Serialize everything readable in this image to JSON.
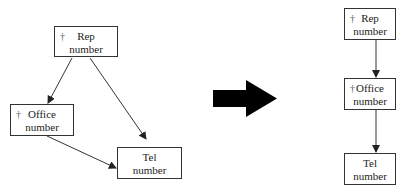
{
  "left_diagram": {
    "nodes": [
      {
        "id": "rep",
        "dagger": "†",
        "line1": "Rep",
        "line2": "number"
      },
      {
        "id": "office",
        "dagger": "†",
        "line1": "Office",
        "line2": "number"
      },
      {
        "id": "tel",
        "dagger": "",
        "line1": "Tel",
        "line2": "number"
      }
    ],
    "edges": [
      [
        "rep",
        "office"
      ],
      [
        "rep",
        "tel"
      ],
      [
        "office",
        "tel"
      ]
    ]
  },
  "transform_arrow": "right",
  "right_diagram": {
    "nodes": [
      {
        "id": "rep",
        "dagger": "†",
        "line1": "Rep",
        "line2": "number"
      },
      {
        "id": "office",
        "dagger": "†",
        "line1": "Office",
        "line2": "number"
      },
      {
        "id": "tel",
        "dagger": "",
        "line1": "Tel",
        "line2": "number"
      }
    ],
    "edges": [
      [
        "rep",
        "office"
      ],
      [
        "office",
        "tel"
      ]
    ]
  }
}
